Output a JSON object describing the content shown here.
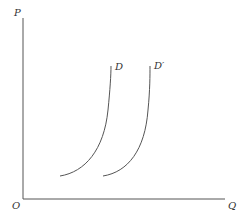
{
  "diagram": {
    "type": "economics-demand-shift",
    "axes": {
      "y_label": "P",
      "x_label": "Q",
      "origin_label": "O"
    },
    "curves": [
      {
        "name": "D",
        "label": "D"
      },
      {
        "name": "D-prime",
        "label": "D′"
      }
    ],
    "colors": {
      "axis": "#555555",
      "curve": "#555555",
      "text": "#333333",
      "background": "#ffffff"
    }
  }
}
